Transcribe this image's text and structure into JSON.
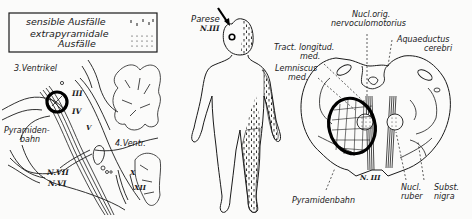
{
  "legend": {
    "items": [
      {
        "label": "sensible Ausfälle",
        "symbol": "vertical-dashes"
      },
      {
        "label_line1": "extrapyramidale",
        "label_line2": "Ausfälle",
        "symbol": "dots"
      }
    ]
  },
  "sagittal_panel": {
    "labels": {
      "ventricle3": "3.Ventrikel",
      "pyramid_line1": "Pyramiden-",
      "pyramid_line2": "bahn",
      "ventricle4": "4.Ventr.",
      "n3": "III",
      "n4": "IV",
      "n5": "V",
      "n7": "N.VII",
      "n6": "N.VI",
      "n10": "X",
      "n12": "XII"
    }
  },
  "figure_panel": {
    "labels": {
      "paresis_line1": "Parese",
      "paresis_line2": "N.III"
    }
  },
  "cross_section_panel": {
    "labels": {
      "nucl_line1": "Nucl.orig.",
      "nucl_line2": "nervoculomotorius",
      "aqueduct_line1": "Aquaeductus",
      "aqueduct_line2": "cerebri",
      "tract_line1": "Tract. longitud.",
      "tract_line2": "med.",
      "lemn_line1": "Lemniscus",
      "lemn_line2": "med.",
      "n3": "N. III",
      "pyramid": "Pyramidenbahn",
      "ruber_line1": "Nucl.",
      "ruber_line2": "ruber",
      "nigra_line1": "Subst.",
      "nigra_line2": "nigra"
    }
  },
  "colors": {
    "ink": "#1a1a1a",
    "paper": "#fbfbfa"
  }
}
